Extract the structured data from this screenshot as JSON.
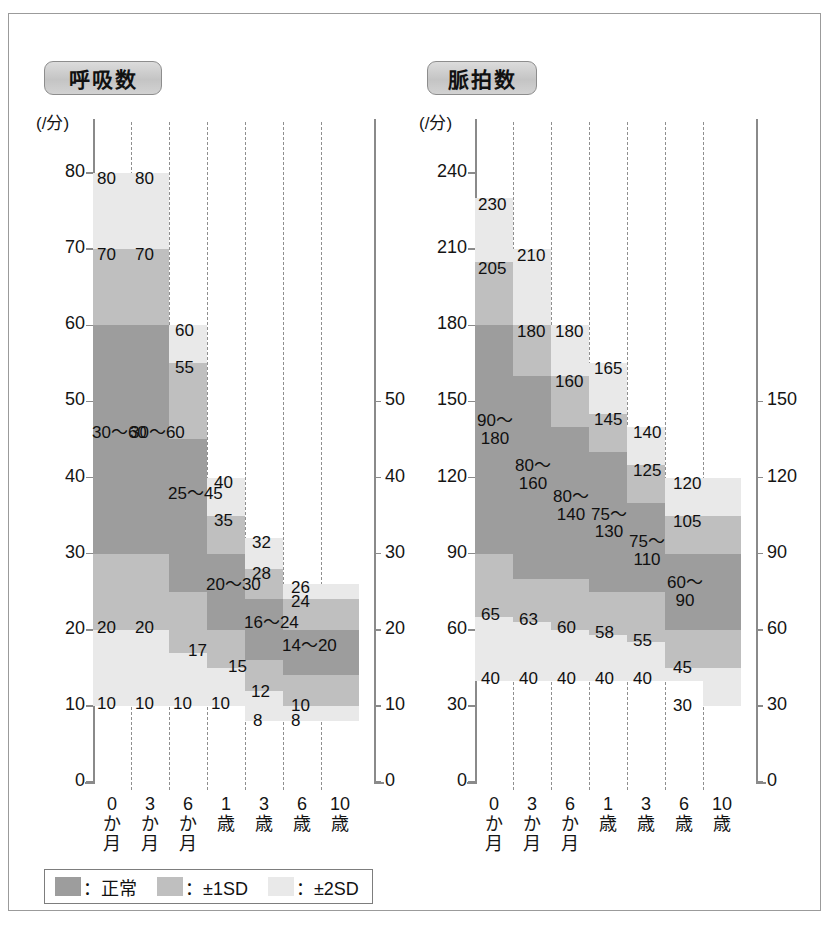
{
  "chart_data": [
    {
      "type": "bar",
      "title": "呼吸数",
      "ylabel": "(/分)",
      "xlabel": "",
      "ylim": [
        0,
        90
      ],
      "yticks": [
        0,
        10,
        20,
        30,
        40,
        50,
        60,
        70,
        80
      ],
      "yticks_right": [
        0,
        10,
        20,
        30,
        40,
        50
      ],
      "grid": true,
      "legend_position": "bottom",
      "categories": [
        "0か月",
        "3か月",
        "6か月",
        "1歳",
        "3歳",
        "6歳",
        "10歳"
      ],
      "series": [
        {
          "name": "±2SD",
          "lower": [
            10,
            10,
            10,
            10,
            8,
            8,
            8
          ],
          "upper": [
            80,
            80,
            60,
            40,
            32,
            26,
            26
          ]
        },
        {
          "name": "±1SD",
          "lower": [
            20,
            20,
            17,
            15,
            12,
            10,
            10
          ],
          "upper": [
            70,
            70,
            55,
            35,
            28,
            24,
            24
          ]
        },
        {
          "name": "正常",
          "lower": [
            30,
            30,
            25,
            20,
            16,
            14,
            14
          ],
          "upper": [
            60,
            60,
            45,
            30,
            24,
            20,
            20
          ]
        }
      ],
      "annotations": [
        {
          "category": "0か月",
          "normal": "30〜60",
          "sd1_low": "20",
          "sd1_high": "70",
          "sd2_low": "10",
          "sd2_high": "80"
        },
        {
          "category": "3か月",
          "normal": "30〜60",
          "sd1_low": "20",
          "sd1_high": "70",
          "sd2_low": "10",
          "sd2_high": "80"
        },
        {
          "category": "6か月",
          "normal": "25〜45",
          "sd1_low": "17",
          "sd1_high": "55",
          "sd2_low": "10",
          "sd2_high": "60"
        },
        {
          "category": "1歳",
          "normal": "20〜30",
          "sd1_low": "15",
          "sd1_high": "35",
          "sd2_low": "10",
          "sd2_high": "40"
        },
        {
          "category": "3歳",
          "normal": "16〜24",
          "sd1_low": "12",
          "sd1_high": "28",
          "sd2_low": "8",
          "sd2_high": "32"
        },
        {
          "category": "6歳",
          "normal": "14〜20",
          "sd1_low": "10",
          "sd1_high": "24",
          "sd2_low": "8",
          "sd2_high": "26"
        },
        {
          "category": "10歳",
          "normal": "14〜20",
          "sd1_low": "10",
          "sd1_high": "24",
          "sd2_low": "8",
          "sd2_high": "26"
        }
      ]
    },
    {
      "type": "bar",
      "title": "脈拍数",
      "ylabel": "(/分)",
      "xlabel": "",
      "ylim": [
        0,
        270
      ],
      "yticks": [
        0,
        30,
        60,
        90,
        120,
        150,
        180,
        210,
        240
      ],
      "yticks_right": [
        0,
        30,
        60,
        90,
        120,
        150
      ],
      "grid": true,
      "legend_position": "bottom",
      "categories": [
        "0か月",
        "3か月",
        "6か月",
        "1歳",
        "3歳",
        "6歳",
        "10歳"
      ],
      "series": [
        {
          "name": "±2SD",
          "lower": [
            40,
            40,
            40,
            40,
            40,
            40,
            30
          ],
          "upper": [
            230,
            210,
            180,
            165,
            140,
            120,
            120
          ]
        },
        {
          "name": "±1SD",
          "lower": [
            65,
            63,
            60,
            58,
            55,
            45,
            45
          ],
          "upper": [
            205,
            180,
            160,
            145,
            125,
            105,
            105
          ]
        },
        {
          "name": "正常",
          "lower": [
            90,
            80,
            80,
            75,
            75,
            60,
            60
          ],
          "upper": [
            180,
            160,
            140,
            130,
            110,
            90,
            90
          ]
        }
      ],
      "annotations": [
        {
          "category": "0か月",
          "normal": "90〜180",
          "sd1_low": "65",
          "sd1_high": "205",
          "sd2_low": "40",
          "sd2_high": "230"
        },
        {
          "category": "3か月",
          "normal": "80〜160",
          "sd1_low": "63",
          "sd1_high": "180",
          "sd2_low": "40",
          "sd2_high": "210"
        },
        {
          "category": "6か月",
          "normal": "80〜140",
          "sd1_low": "60",
          "sd1_high": "160",
          "sd2_low": "40",
          "sd2_high": "180"
        },
        {
          "category": "1歳",
          "normal": "75〜130",
          "sd1_low": "58",
          "sd1_high": "145",
          "sd2_low": "40",
          "sd2_high": "165"
        },
        {
          "category": "3歳",
          "normal": "75〜110",
          "sd1_low": "55",
          "sd1_high": "125",
          "sd2_low": "40",
          "sd2_high": "140"
        },
        {
          "category": "6歳",
          "normal": "60〜90",
          "sd1_low": "45",
          "sd1_high": "105",
          "sd2_low": "30",
          "sd2_high": "120"
        },
        {
          "category": "10歳",
          "normal": "60〜90",
          "sd1_low": "45",
          "sd1_high": "105",
          "sd2_low": "30",
          "sd2_high": "120"
        }
      ]
    }
  ],
  "charts": {
    "respiration": {
      "title": "呼吸数",
      "unit": "(/分)",
      "y_ticks": [
        "0",
        "10",
        "20",
        "30",
        "40",
        "50",
        "60",
        "70",
        "80"
      ],
      "y_ticks_right": [
        "0",
        "10",
        "20",
        "30",
        "40",
        "50"
      ],
      "x_categories": [
        {
          "num": "0",
          "l2": "か",
          "l3": "月"
        },
        {
          "num": "3",
          "l2": "か",
          "l3": "月"
        },
        {
          "num": "6",
          "l2": "か",
          "l3": "月"
        },
        {
          "num": "1",
          "l2": "歳",
          "l3": ""
        },
        {
          "num": "3",
          "l2": "歳",
          "l3": ""
        },
        {
          "num": "6",
          "l2": "歳",
          "l3": ""
        },
        {
          "num": "10",
          "l2": "歳",
          "l3": ""
        }
      ],
      "labels": {
        "c0_sd2_hi": "80",
        "c0_sd1_hi": "70",
        "c0_norm": "30〜60",
        "c0_sd1_lo": "20",
        "c0_sd2_lo": "10",
        "c1_sd2_hi": "80",
        "c1_sd1_hi": "70",
        "c1_norm": "30〜60",
        "c1_sd1_lo": "20",
        "c1_sd2_lo": "10",
        "c2_sd2_hi": "60",
        "c2_sd1_hi": "55",
        "c2_norm": "25〜45",
        "c2_sd1_lo": "17",
        "c2_sd2_lo": "10",
        "c3_sd2_hi": "40",
        "c3_sd1_hi": "35",
        "c3_norm": "20〜30",
        "c3_sd1_lo": "15",
        "c3_sd2_lo": "10",
        "c4_sd2_hi": "32",
        "c4_sd1_hi": "28",
        "c4_norm": "16〜24",
        "c4_sd1_lo": "12",
        "c4_sd2_lo": "8",
        "c5_sd2_hi": "26",
        "c5_sd1_hi": "24",
        "c5_norm": "14〜20",
        "c5_sd1_lo": "10",
        "c5_sd2_lo": "8"
      }
    },
    "pulse": {
      "title": "脈拍数",
      "unit": "(/分)",
      "y_ticks": [
        "0",
        "30",
        "60",
        "90",
        "120",
        "150",
        "180",
        "210",
        "240"
      ],
      "y_ticks_right": [
        "0",
        "30",
        "60",
        "90",
        "120",
        "150"
      ],
      "x_categories": [
        {
          "num": "0",
          "l2": "か",
          "l3": "月"
        },
        {
          "num": "3",
          "l2": "か",
          "l3": "月"
        },
        {
          "num": "6",
          "l2": "か",
          "l3": "月"
        },
        {
          "num": "1",
          "l2": "歳",
          "l3": ""
        },
        {
          "num": "3",
          "l2": "歳",
          "l3": ""
        },
        {
          "num": "6",
          "l2": "歳",
          "l3": ""
        },
        {
          "num": "10",
          "l2": "歳",
          "l3": ""
        }
      ],
      "labels": {
        "c0_sd2_hi": "230",
        "c0_sd1_hi": "205",
        "c0_norm": "90〜\n180",
        "c0_sd1_lo": "65",
        "c0_sd2_lo": "40",
        "c1_sd2_hi": "210",
        "c1_sd1_hi": "180",
        "c1_norm": "80〜\n160",
        "c1_sd1_lo": "63",
        "c1_sd2_lo": "40",
        "c2_sd2_hi": "180",
        "c2_sd1_hi": "160",
        "c2_norm": "80〜\n140",
        "c2_sd1_lo": "60",
        "c2_sd2_lo": "40",
        "c3_sd2_hi": "165",
        "c3_sd1_hi": "145",
        "c3_norm": "75〜\n130",
        "c3_sd1_lo": "58",
        "c3_sd2_lo": "40",
        "c4_sd2_hi": "140",
        "c4_sd1_hi": "125",
        "c4_norm": "75〜\n110",
        "c4_sd1_lo": "55",
        "c4_sd2_lo": "40",
        "c5_sd2_hi": "120",
        "c5_sd1_hi": "105",
        "c5_norm": "60〜\n90",
        "c5_sd1_lo": "45",
        "c5_sd2_lo": "30"
      }
    }
  },
  "legend": {
    "items": [
      {
        "label": "：正常",
        "color": "#9d9d9d"
      },
      {
        "label": "：±1SD",
        "color": "#bfbfbf"
      },
      {
        "label": "：±2SD",
        "color": "#e9e9e9"
      }
    ]
  }
}
